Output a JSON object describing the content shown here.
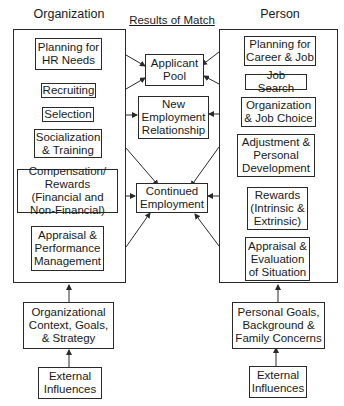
{
  "headings": {
    "organization": "Organization",
    "results": "Results of Match",
    "person": "Person"
  },
  "organization_items": [
    "Planning for HR Needs",
    "Recruiting",
    "Selection",
    "Socialization & Training",
    "Compensation/ Rewards (Financial and Non-Financial)",
    "Appraisal & Performance Management"
  ],
  "results_items": [
    "Applicant Pool",
    "New Employment Relationship",
    "Continued Employment"
  ],
  "person_items": [
    "Planning for Career & Job",
    "Job Search",
    "Organization & Job Choice",
    "Adjustment & Personal Development",
    "Rewards (Intrinsic & Extrinsic)",
    "Appraisal & Evaluation of Situation"
  ],
  "org_inputs": {
    "context": "Organizational Context, Goals, & Strategy",
    "external": "External Influences"
  },
  "person_inputs": {
    "context": "Personal Goals, Background & Family Concerns",
    "external": "External Influences"
  },
  "colors": {
    "line": "#2a2a2a",
    "background": "#ffffff"
  }
}
